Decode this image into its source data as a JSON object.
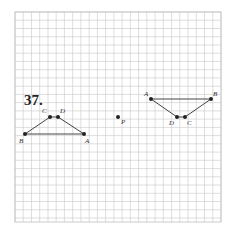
{
  "problem": {
    "number": "37."
  },
  "grid": {
    "x0": 15,
    "y0": 12,
    "x1": 221,
    "y1": 222,
    "step": 8.24,
    "line_color": "#c8c8c8",
    "border_color": "#bdbdbd"
  },
  "figures": {
    "original": {
      "name": "trapezoid ABCD (pre-image)",
      "points": [
        {
          "label": "A",
          "x": 84,
          "y": 134,
          "lx": 85,
          "ly": 138
        },
        {
          "label": "B",
          "x": 25,
          "y": 134,
          "lx": 19,
          "ly": 138
        },
        {
          "label": "C",
          "x": 50,
          "y": 117,
          "lx": 42,
          "ly": 108
        },
        {
          "label": "D",
          "x": 58,
          "y": 117,
          "lx": 60,
          "ly": 108
        }
      ],
      "segments": [
        [
          "B",
          "C"
        ],
        [
          "C",
          "D"
        ],
        [
          "D",
          "A"
        ],
        [
          "A",
          "B"
        ]
      ]
    },
    "image": {
      "name": "trapezoid A'B'C'D' (rotated image)",
      "points": [
        {
          "label": "A",
          "x": 151,
          "y": 99,
          "lx": 144,
          "ly": 91
        },
        {
          "label": "B",
          "x": 211,
          "y": 99,
          "lx": 213,
          "ly": 91
        },
        {
          "label": "C",
          "x": 185,
          "y": 117,
          "lx": 187,
          "ly": 120
        },
        {
          "label": "D",
          "x": 177,
          "y": 117,
          "lx": 169,
          "ly": 120
        }
      ],
      "segments": [
        [
          "A",
          "B"
        ],
        [
          "B",
          "C"
        ],
        [
          "C",
          "D"
        ],
        [
          "D",
          "A"
        ]
      ]
    }
  },
  "center": {
    "label": "P",
    "x": 118,
    "y": 117,
    "lx": 121,
    "ly": 119
  },
  "colors": {
    "ink": "#222222",
    "segment": "#444444"
  }
}
